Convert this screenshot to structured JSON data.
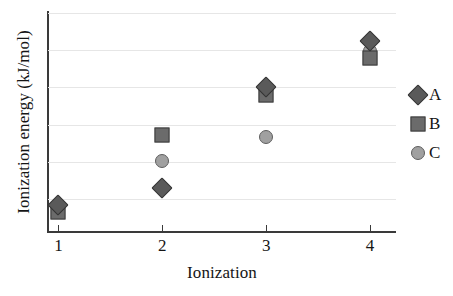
{
  "chart_data": {
    "type": "scatter",
    "title": "",
    "xlabel": "Ionization",
    "ylabel": "Ionization energy (kJ/mol)",
    "x": [
      1,
      2,
      3,
      4
    ],
    "xticklabels": [
      "1",
      "2",
      "3",
      "4"
    ],
    "yticklabels": [],
    "xlim": [
      0.9,
      4.25
    ],
    "ylim": [
      0,
      6.0
    ],
    "grid": "horizontal",
    "gridline_count": 6,
    "legend_position": "right",
    "series": [
      {
        "name": "A",
        "marker": "diamond",
        "color": "#5a5a5a",
        "edge_color": "#333333",
        "values": [
          0.75,
          1.2,
          3.95,
          5.2
        ]
      },
      {
        "name": "B",
        "marker": "square",
        "color": "#6b6b6b",
        "edge_color": "#3d3d3d",
        "values": [
          0.55,
          2.65,
          3.75,
          4.75
        ]
      },
      {
        "name": "C",
        "marker": "circle",
        "color": "#a0a0a0",
        "edge_color": "#5e5e5e",
        "values": [
          0.7,
          1.95,
          2.6,
          4.95
        ]
      }
    ]
  },
  "legend": {
    "items": [
      {
        "label": "A",
        "marker": "diamond"
      },
      {
        "label": "B",
        "marker": "square"
      },
      {
        "label": "C",
        "marker": "circle"
      }
    ]
  },
  "axes": {
    "x_title": "Ionization",
    "y_title": "Ionization energy (kJ/mol)",
    "x_ticks": [
      "1",
      "2",
      "3",
      "4"
    ]
  },
  "colors": {
    "axis": "#3a3a3a",
    "grid": "#e6e6e6",
    "text": "#151515",
    "series_a": "#5a5a5a",
    "series_b": "#6b6b6b",
    "series_c": "#a0a0a0"
  }
}
